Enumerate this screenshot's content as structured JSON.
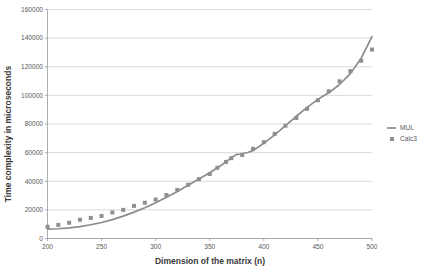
{
  "chart_data": {
    "type": "line",
    "title": "",
    "xlabel": "Dimension of the matrix (n)",
    "ylabel": "Time complexity in microseconds",
    "xlim": [
      200,
      500
    ],
    "ylim": [
      0,
      160000
    ],
    "xticks": [
      200,
      250,
      300,
      350,
      400,
      450,
      500
    ],
    "yticks": [
      0,
      20000,
      40000,
      60000,
      80000,
      100000,
      120000,
      140000,
      160000
    ],
    "xtick_labels": [
      "200",
      "250",
      "300",
      "350",
      "400",
      "450",
      "500"
    ],
    "ytick_labels": [
      "0",
      "20000",
      "40000",
      "60000",
      "80000",
      "100000",
      "120000",
      "140000",
      "160000"
    ],
    "grid": "horizontal",
    "legend_position": "right",
    "colors": {
      "line": "#8c8c8c",
      "marker": "#8f8f8f",
      "gridline": "#c9c9c9",
      "axis": "#9a9a9a",
      "text": "#595959"
    },
    "series": [
      {
        "name": "MUL",
        "style": "line",
        "x": [
          200,
          210,
          220,
          230,
          240,
          250,
          260,
          270,
          280,
          290,
          300,
          310,
          320,
          330,
          340,
          350,
          355,
          360,
          365,
          370,
          372,
          375,
          378,
          380,
          385,
          390,
          400,
          410,
          420,
          430,
          440,
          450,
          455,
          460,
          465,
          470,
          480,
          490,
          500
        ],
        "values": [
          6500,
          6800,
          7400,
          8300,
          9600,
          11200,
          13200,
          15600,
          18400,
          21500,
          25000,
          28800,
          32900,
          37200,
          41600,
          46000,
          48400,
          50800,
          53500,
          56400,
          57400,
          58800,
          59000,
          59200,
          60100,
          61400,
          66500,
          72400,
          78800,
          85400,
          91600,
          97200,
          99600,
          101900,
          104600,
          107600,
          115200,
          126000,
          141000
        ]
      },
      {
        "name": "Calc3",
        "style": "markers",
        "x": [
          200,
          210,
          220,
          230,
          240,
          250,
          260,
          270,
          280,
          290,
          300,
          310,
          320,
          330,
          340,
          350,
          357,
          365,
          370,
          380,
          390,
          400,
          410,
          420,
          430,
          440,
          450,
          460,
          470,
          480,
          490,
          500
        ],
        "values": [
          8200,
          9500,
          11000,
          13100,
          14400,
          15800,
          18200,
          20000,
          22800,
          25000,
          27200,
          30400,
          33900,
          37500,
          41500,
          45100,
          49400,
          53500,
          56100,
          58400,
          62600,
          67300,
          73100,
          78800,
          84200,
          90600,
          96600,
          102800,
          109800,
          116900,
          124200,
          132000
        ]
      }
    ]
  },
  "legend": {
    "items": [
      {
        "label": "MUL",
        "marker": "line-swatch"
      },
      {
        "label": "Calc3",
        "marker": "square-swatch"
      }
    ]
  }
}
